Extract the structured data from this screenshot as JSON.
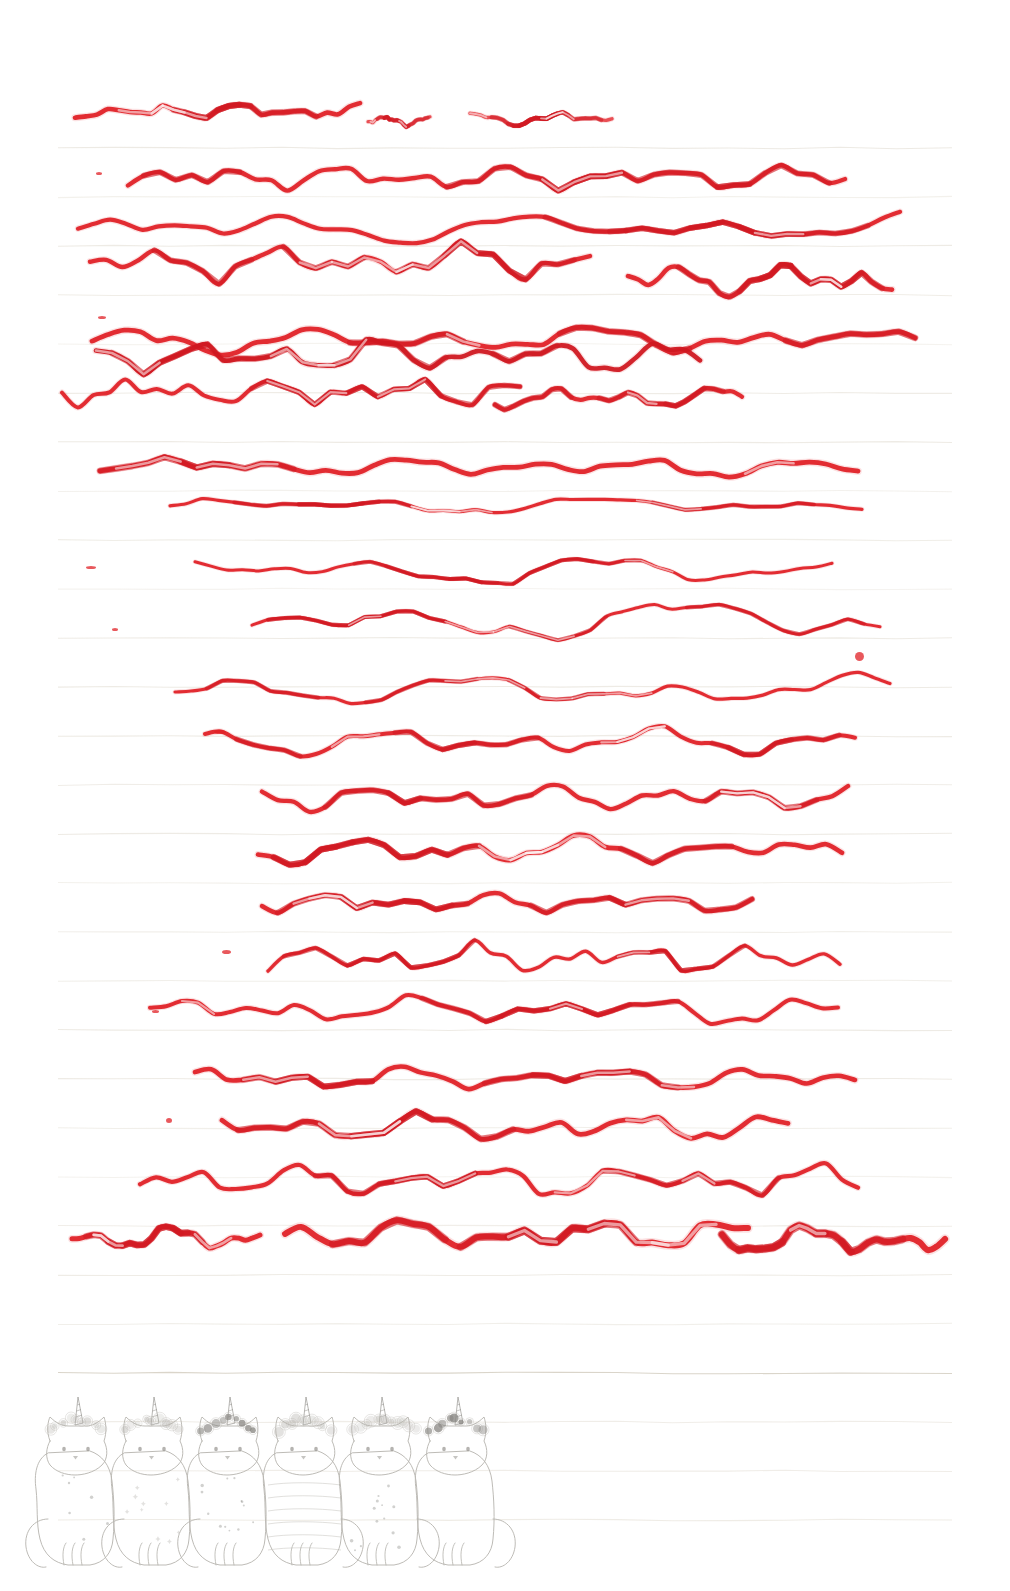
{
  "page": {
    "width": 1010,
    "height": 1591,
    "paper_color": "#ffffff",
    "rule_color": "#e9e5dd",
    "rule_color_strong": "#d8d3c7",
    "ink_color": "#e02026",
    "ink_color_light": "#e8454a",
    "ink_color_dark": "#cf1720",
    "pencil_color": "#b9b7b2",
    "pencil_color_dark": "#8d8b86"
  },
  "ruling": {
    "first_y": 148,
    "spacing": 49,
    "count": 29,
    "x_start": 58,
    "x_end": 952,
    "strong_indices": [
      25
    ]
  },
  "strokes": {
    "count": 21,
    "description": "hand-drawn red felt-tip wavy horizontal practice lines",
    "items": [
      {
        "id": "stroke-1",
        "y": 112,
        "x0": 75,
        "x1": 360,
        "width": 4.6,
        "color": "#e02026",
        "amp": 7,
        "freq": 9,
        "seed": 11
      },
      {
        "id": "stroke-1b",
        "y": 120,
        "x0": 368,
        "x1": 430,
        "width": 3.2,
        "color": "#e8454a",
        "amp": 5,
        "freq": 3,
        "seed": 62
      },
      {
        "id": "stroke-1c",
        "y": 120,
        "x0": 470,
        "x1": 612,
        "width": 3.4,
        "color": "#e8454a",
        "amp": 6,
        "freq": 4,
        "seed": 77
      },
      {
        "id": "stroke-2",
        "y": 178,
        "x0": 128,
        "x1": 845,
        "width": 4.4,
        "color": "#e02026",
        "amp": 11,
        "freq": 16,
        "seed": 23
      },
      {
        "id": "stroke-3",
        "y": 228,
        "x0": 78,
        "x1": 900,
        "width": 4.2,
        "color": "#e02026",
        "amp": 13,
        "freq": 8,
        "seed": 31
      },
      {
        "id": "stroke-4",
        "y": 262,
        "x0": 90,
        "x1": 590,
        "width": 4.4,
        "color": "#e02026",
        "amp": 16,
        "freq": 10,
        "seed": 47
      },
      {
        "id": "stroke-5",
        "y": 280,
        "x0": 628,
        "x1": 892,
        "width": 4.6,
        "color": "#e02026",
        "amp": 15,
        "freq": 6,
        "seed": 53
      },
      {
        "id": "stroke-6",
        "y": 340,
        "x0": 92,
        "x1": 915,
        "width": 4.8,
        "color": "#e02026",
        "amp": 12,
        "freq": 11,
        "seed": 67
      },
      {
        "id": "stroke-7",
        "y": 356,
        "x0": 96,
        "x1": 700,
        "width": 4.6,
        "color": "#cf1720",
        "amp": 14,
        "freq": 13,
        "seed": 83
      },
      {
        "id": "stroke-8",
        "y": 392,
        "x0": 62,
        "x1": 520,
        "width": 4.0,
        "color": "#e02026",
        "amp": 13,
        "freq": 12,
        "seed": 97
      },
      {
        "id": "stroke-9",
        "y": 398,
        "x0": 495,
        "x1": 742,
        "width": 4.2,
        "color": "#e02026",
        "amp": 10,
        "freq": 6,
        "seed": 101
      },
      {
        "id": "stroke-10",
        "y": 466,
        "x0": 100,
        "x1": 858,
        "width": 4.8,
        "color": "#e02026",
        "amp": 8,
        "freq": 12,
        "seed": 113
      },
      {
        "id": "stroke-11",
        "y": 505,
        "x0": 170,
        "x1": 862,
        "width": 3.2,
        "color": "#e02026",
        "amp": 7,
        "freq": 7,
        "seed": 127
      },
      {
        "id": "stroke-12",
        "y": 570,
        "x0": 195,
        "x1": 832,
        "width": 3.0,
        "color": "#e02026",
        "amp": 14,
        "freq": 6,
        "seed": 139
      },
      {
        "id": "stroke-13",
        "y": 620,
        "x0": 252,
        "x1": 880,
        "width": 3.0,
        "color": "#e02026",
        "amp": 18,
        "freq": 5,
        "seed": 149
      },
      {
        "id": "stroke-14",
        "y": 690,
        "x0": 175,
        "x1": 890,
        "width": 3.2,
        "color": "#e02026",
        "amp": 13,
        "freq": 7,
        "seed": 163
      },
      {
        "id": "stroke-15",
        "y": 742,
        "x0": 205,
        "x1": 855,
        "width": 4.0,
        "color": "#e02026",
        "amp": 12,
        "freq": 9,
        "seed": 173
      },
      {
        "id": "stroke-16",
        "y": 798,
        "x0": 262,
        "x1": 848,
        "width": 4.4,
        "color": "#e02026",
        "amp": 11,
        "freq": 12,
        "seed": 181
      },
      {
        "id": "stroke-17",
        "y": 850,
        "x0": 258,
        "x1": 842,
        "width": 4.6,
        "color": "#e02026",
        "amp": 12,
        "freq": 10,
        "seed": 191
      },
      {
        "id": "stroke-18",
        "y": 902,
        "x0": 262,
        "x1": 752,
        "width": 4.4,
        "color": "#e02026",
        "amp": 9,
        "freq": 11,
        "seed": 199
      },
      {
        "id": "stroke-19",
        "y": 958,
        "x0": 268,
        "x1": 840,
        "width": 3.4,
        "color": "#e02026",
        "amp": 14,
        "freq": 13,
        "seed": 211
      },
      {
        "id": "stroke-20",
        "y": 1010,
        "x0": 150,
        "x1": 838,
        "width": 4.0,
        "color": "#e02026",
        "amp": 12,
        "freq": 11,
        "seed": 223
      },
      {
        "id": "stroke-21",
        "y": 1078,
        "x0": 195,
        "x1": 855,
        "width": 4.6,
        "color": "#e02026",
        "amp": 10,
        "freq": 12,
        "seed": 233
      },
      {
        "id": "stroke-22",
        "y": 1128,
        "x0": 222,
        "x1": 788,
        "width": 4.8,
        "color": "#e02026",
        "amp": 13,
        "freq": 10,
        "seed": 241
      },
      {
        "id": "stroke-23",
        "y": 1180,
        "x0": 140,
        "x1": 858,
        "width": 4.2,
        "color": "#e02026",
        "amp": 14,
        "freq": 14,
        "seed": 251
      },
      {
        "id": "stroke-24",
        "y": 1238,
        "x0": 72,
        "x1": 260,
        "width": 5.0,
        "color": "#e02026",
        "amp": 10,
        "freq": 5,
        "seed": 263
      },
      {
        "id": "stroke-25",
        "y": 1234,
        "x0": 285,
        "x1": 748,
        "width": 6.0,
        "color": "#e02026",
        "amp": 14,
        "freq": 9,
        "seed": 271
      },
      {
        "id": "stroke-26",
        "y": 1240,
        "x0": 722,
        "x1": 945,
        "width": 6.2,
        "color": "#e02026",
        "amp": 13,
        "freq": 5,
        "seed": 281
      }
    ]
  },
  "speck_marks": [
    {
      "id": "speck-1",
      "x": 96,
      "y": 172,
      "w": 6,
      "h": 3
    },
    {
      "id": "speck-2",
      "x": 98,
      "y": 316,
      "w": 8,
      "h": 3
    },
    {
      "id": "speck-3",
      "x": 86,
      "y": 566,
      "w": 10,
      "h": 3
    },
    {
      "id": "speck-4",
      "x": 112,
      "y": 628,
      "w": 6,
      "h": 3
    },
    {
      "id": "speck-5",
      "x": 855,
      "y": 652,
      "w": 9,
      "h": 9
    },
    {
      "id": "speck-6",
      "x": 214,
      "y": 730,
      "w": 12,
      "h": 4
    },
    {
      "id": "speck-7",
      "x": 222,
      "y": 950,
      "w": 9,
      "h": 4
    },
    {
      "id": "speck-8",
      "x": 166,
      "y": 1118,
      "w": 6,
      "h": 5
    },
    {
      "id": "speck-9",
      "x": 152,
      "y": 1010,
      "w": 7,
      "h": 3
    }
  ],
  "cats": {
    "label": "unicorn-cat illustration band",
    "count": 6,
    "band_x": 28,
    "band_y": 1415,
    "band_width": 470,
    "band_height": 165,
    "items": [
      {
        "id": "cat-1",
        "name": "cat-tail-left-plain",
        "x": 40,
        "tail": "left",
        "pattern": "dots-sparse",
        "crown": "flowers-light"
      },
      {
        "id": "cat-2",
        "name": "cat-tail-left-stars",
        "x": 116,
        "tail": "left",
        "pattern": "stars",
        "crown": "flowers-ring"
      },
      {
        "id": "cat-3",
        "name": "cat-tail-left-dark-crown",
        "x": 192,
        "tail": "left",
        "pattern": "dots",
        "crown": "flowers-dark"
      },
      {
        "id": "cat-4",
        "name": "cat-striped",
        "x": 268,
        "tail": "right",
        "pattern": "stripes",
        "crown": "flowers-medium"
      },
      {
        "id": "cat-5",
        "name": "cat-spotted",
        "x": 344,
        "tail": "right",
        "pattern": "spots",
        "crown": "flowers-wide"
      },
      {
        "id": "cat-6",
        "name": "cat-front-facing",
        "x": 420,
        "tail": "right",
        "pattern": "plain",
        "crown": "flowers-dark-small"
      }
    ]
  }
}
